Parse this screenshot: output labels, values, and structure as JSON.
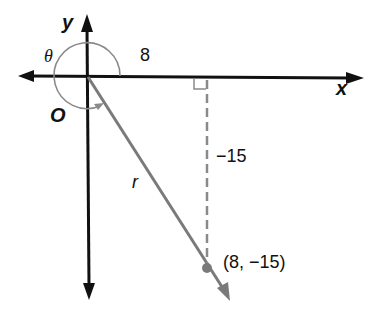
{
  "diagram": {
    "type": "angle-in-standard-position",
    "labels": {
      "x_axis": "x",
      "y_axis": "y",
      "origin": "O",
      "angle": "θ",
      "radius": "r",
      "horizontal_leg": "8",
      "vertical_leg": "−15",
      "point": "(8, −15)"
    },
    "point": {
      "x": 8,
      "y": -15
    },
    "colors": {
      "axes": "#111111",
      "ray": "#7a7a7a",
      "arc": "#8a8a8a",
      "dashed": "#8a8a8a",
      "point": "#7a7a7a"
    }
  }
}
